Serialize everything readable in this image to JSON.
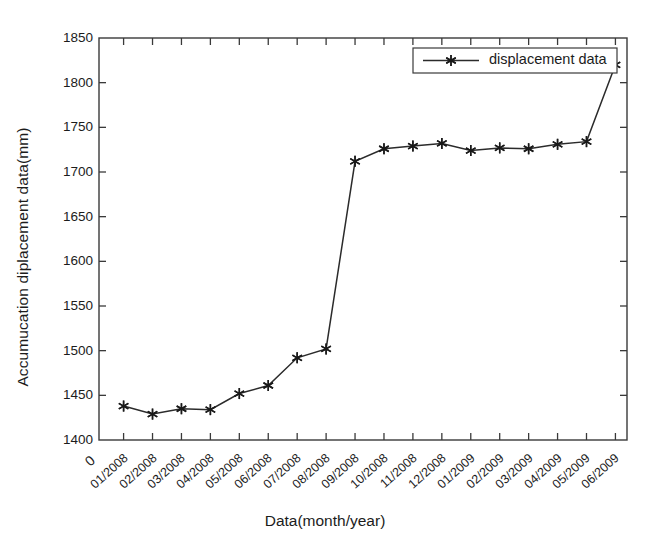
{
  "chart_data": {
    "type": "line",
    "title": "",
    "xlabel": "Data(month/year)",
    "ylabel": "Accumucation diplacement data(mm)",
    "origin_label": "0",
    "categories": [
      "01/2008",
      "02/2008",
      "03/2008",
      "04/2008",
      "05/2008",
      "06/2008",
      "07/2008",
      "08/2008",
      "09/2008",
      "10/2008",
      "11/2008",
      "12/2008",
      "01/2009",
      "02/2009",
      "03/2009",
      "04/2009",
      "05/2009",
      "06/2009"
    ],
    "values": [
      1438,
      1429,
      1435,
      1434,
      1452,
      1461,
      1492,
      1502,
      1712,
      1726,
      1729,
      1732,
      1724,
      1727,
      1726,
      1731,
      1734,
      1820
    ],
    "series": [
      {
        "name": "displacement data",
        "values": [
          1438,
          1429,
          1435,
          1434,
          1452,
          1461,
          1492,
          1502,
          1712,
          1726,
          1729,
          1732,
          1724,
          1727,
          1726,
          1731,
          1734,
          1820
        ]
      }
    ],
    "ylim": [
      1400,
      1850
    ],
    "yticks": [
      1400,
      1450,
      1500,
      1550,
      1600,
      1650,
      1700,
      1750,
      1800,
      1850
    ],
    "ytick_labels": [
      "1400",
      "1450",
      "1500",
      "1550",
      "1600",
      "1650",
      "1700",
      "1750",
      "1800",
      "1850"
    ],
    "grid": false,
    "legend": {
      "position": "top-right",
      "entries": [
        "displacement data"
      ]
    },
    "marker": "star",
    "line_color": "#2b2b2b",
    "marker_color": "#1a1a1a"
  }
}
